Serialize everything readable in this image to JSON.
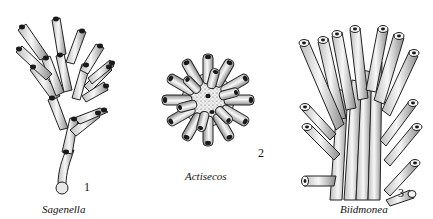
{
  "figures": [
    {
      "number": "1",
      "name": "Sagenella"
    },
    {
      "number": "2",
      "name": "Actisecos"
    },
    {
      "number": "3",
      "name": "Biidmonea"
    }
  ],
  "colors": {
    "ink": "#111111",
    "tube_fill": "#f2f2f2",
    "shade": "#9a9a9a",
    "aperture": "#1a1a1a"
  }
}
